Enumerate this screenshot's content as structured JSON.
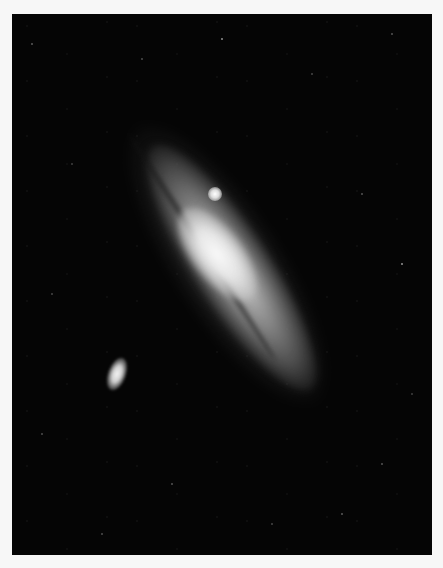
{
  "image": {
    "subject": "Spiral galaxy with two satellite galaxies against a star field",
    "style": "black-and-white astronomical photograph",
    "colors": {
      "page_background": "#f7f7f7",
      "sky": "#050505",
      "galaxy_core": "#f0f0f0",
      "galaxy_disk": "#9a9a9a"
    },
    "elements": [
      {
        "name": "main-galaxy",
        "description": "large tilted spiral galaxy running diagonally from upper-left to lower-right"
      },
      {
        "name": "satellite-galaxy-upper",
        "description": "small bright compact glow near upper edge of disk"
      },
      {
        "name": "satellite-galaxy-lower-left",
        "description": "elongated elliptical glow at lower left"
      },
      {
        "name": "star-field",
        "description": "scattered faint stars across black sky"
      }
    ]
  }
}
